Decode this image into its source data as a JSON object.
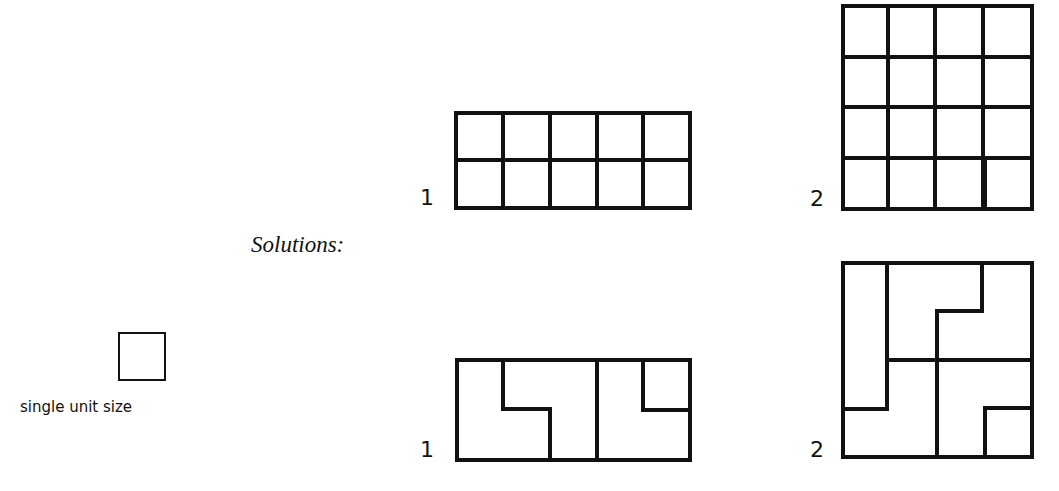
{
  "title": "Solutions:",
  "legend": {
    "label": "single unit size",
    "icon": "unit-square"
  },
  "puzzles": [
    {
      "label": "1",
      "cols": 5,
      "rows": 2,
      "shaded_cell": "top-right"
    },
    {
      "label": "2",
      "cols": 4,
      "rows": 4,
      "shaded_cell": "bottom-right"
    }
  ],
  "solutions": [
    {
      "label": "1",
      "description": "2x5 grid divided into three L-shaped pieces, top-right cell shaded"
    },
    {
      "label": "2",
      "description": "4x4 grid divided into five L-shaped pieces, bottom-right cell shaded"
    }
  ],
  "colors": {
    "ink": "#111111",
    "background": "#ffffff"
  }
}
